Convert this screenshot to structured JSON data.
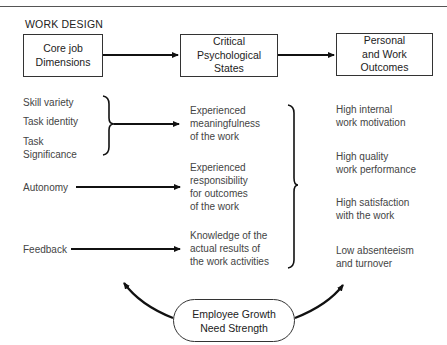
{
  "diagram": {
    "title": "WORK DESIGN",
    "header_boxes": [
      {
        "label": "Core job\nDimensions"
      },
      {
        "label": "Critical\nPsychological\nStates"
      },
      {
        "label": "Personal\nand Work\nOutcomes"
      }
    ],
    "core_dimensions": [
      "Skill variety",
      "Task identity",
      "Task\nSignificance",
      "Autonomy",
      "Feedback"
    ],
    "psychological_states": [
      "Experienced\nmeaningfulness\nof the work",
      "Experienced\nresponsibility\nfor outcomes\nof the work",
      "Knowledge of the\nactual results of\nthe work activities"
    ],
    "outcomes": [
      "High internal\nwork motivation",
      "High quality\nwork performance",
      "High satisfaction\nwith the work",
      "Low absenteeism\nand turnover"
    ],
    "moderator": "Employee Growth\nNeed Strength",
    "colors": {
      "line": "#111111",
      "text": "#2a2a2a",
      "background": "#ffffff"
    }
  }
}
